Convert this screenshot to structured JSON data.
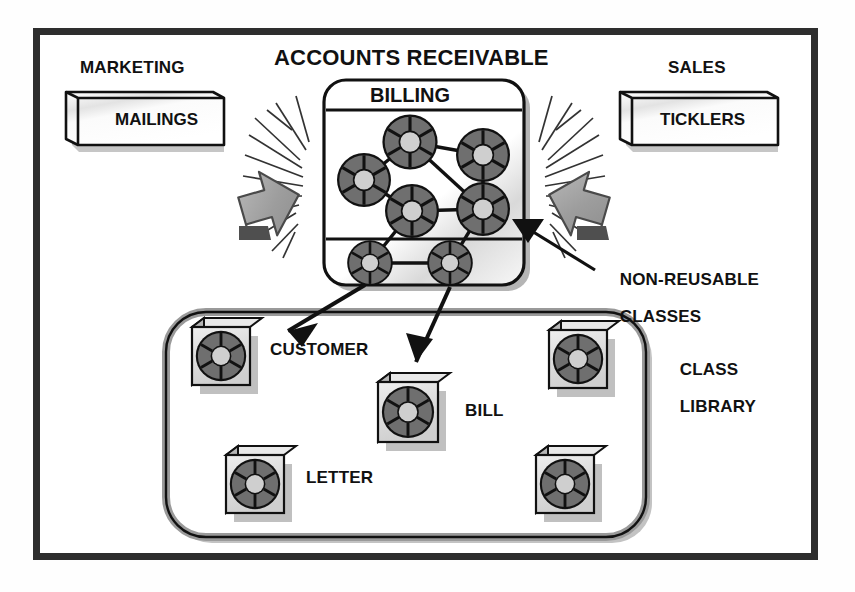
{
  "diagram": {
    "title_accounts_receivable": "ACCOUNTS RECEIVABLE",
    "colors": {
      "ink": "#111111",
      "frame": "#2e2e2e",
      "icon_dark_gray": "#6f6f6f",
      "icon_light_gray": "#c9c9c9",
      "arrow_gray": "#9a9a9a",
      "paper_white": "#ffffff"
    },
    "departments": [
      {
        "name": "marketing-department",
        "title": "MARKETING",
        "slab_label": "MAILINGS"
      },
      {
        "name": "sales-department",
        "title": "SALES",
        "slab_label": "TICKLERS"
      }
    ],
    "billing_system": {
      "title": "BILLING",
      "node_count": 7,
      "nodes": [
        {
          "id": "n1",
          "cx": 410,
          "cy": 142,
          "r": 27
        },
        {
          "id": "n2",
          "cx": 483,
          "cy": 155,
          "r": 26
        },
        {
          "id": "n3",
          "cx": 364,
          "cy": 180,
          "r": 26
        },
        {
          "id": "n4",
          "cx": 412,
          "cy": 211,
          "r": 26
        },
        {
          "id": "n5",
          "cx": 483,
          "cy": 209,
          "r": 26
        },
        {
          "id": "n6",
          "cx": 370,
          "cy": 263,
          "r": 22
        },
        {
          "id": "n7",
          "cx": 450,
          "cy": 263,
          "r": 22
        }
      ],
      "links": [
        [
          "n1",
          "n2"
        ],
        [
          "n1",
          "n3"
        ],
        [
          "n1",
          "n5"
        ],
        [
          "n2",
          "n5"
        ],
        [
          "n4",
          "n5"
        ],
        [
          "n4",
          "n6"
        ],
        [
          "n3",
          "n4"
        ],
        [
          "n6",
          "n7"
        ],
        [
          "n5",
          "n7"
        ]
      ]
    },
    "annotations": [
      {
        "name": "non-reusable-classes-label",
        "line1": "NON-REUSABLE",
        "line2": "CLASSES"
      },
      {
        "name": "class-library-label",
        "line1": "CLASS",
        "line2": "LIBRARY"
      }
    ],
    "class_library": {
      "title": "CLASS LIBRARY",
      "classes": [
        {
          "id": "customer",
          "label": "CUSTOMER",
          "x": 192,
          "y": 327,
          "size": 56,
          "labelled": true
        },
        {
          "id": "bill",
          "label": "BILL",
          "x": 378,
          "y": 382,
          "size": 58,
          "labelled": true
        },
        {
          "id": "letter",
          "label": "LETTER",
          "x": 226,
          "y": 455,
          "size": 56,
          "labelled": true
        },
        {
          "id": "unlabelled-top-right",
          "label": "",
          "x": 549,
          "y": 330,
          "size": 56,
          "labelled": false
        },
        {
          "id": "unlabelled-bottom-right",
          "label": "",
          "x": 536,
          "y": 455,
          "size": 56,
          "labelled": false
        }
      ]
    },
    "arrows": [
      {
        "name": "impact-arrow-left",
        "direction": "down-left",
        "style": "gray-3d-block-arrow"
      },
      {
        "name": "impact-arrow-right",
        "direction": "down-right",
        "style": "gray-3d-block-arrow"
      },
      {
        "name": "pointer-non-reusable",
        "from": "non-reusable-classes-label",
        "to": "billing-system"
      },
      {
        "name": "derive-arrow-customer",
        "from": "billing-node-n6",
        "to": "class-customer"
      },
      {
        "name": "derive-arrow-bill",
        "from": "billing-node-n7",
        "to": "class-bill"
      }
    ]
  }
}
